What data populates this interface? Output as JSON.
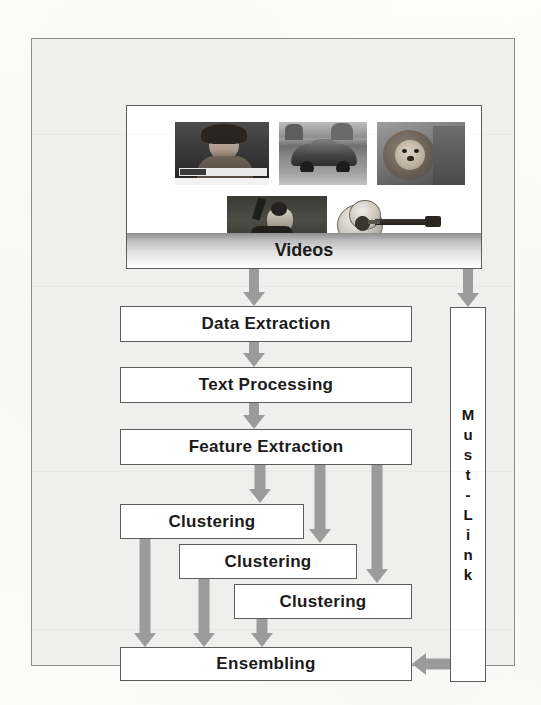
{
  "figure": {
    "source_box_label": "Videos",
    "constraint_label_chars": [
      "M",
      "u",
      "s",
      "t",
      "-",
      "L",
      "i",
      "n",
      "k"
    ],
    "constraint_label": "Must-Link",
    "stages": [
      {
        "id": "data-extraction",
        "label": "Data Extraction"
      },
      {
        "id": "text-processing",
        "label": "Text Processing"
      },
      {
        "id": "feature-extraction",
        "label": "Feature Extraction"
      }
    ],
    "clustering": [
      {
        "id": "clustering-1",
        "label": "Clustering"
      },
      {
        "id": "clustering-2",
        "label": "Clustering"
      },
      {
        "id": "clustering-3",
        "label": "Clustering"
      }
    ],
    "output": {
      "id": "ensembling",
      "label": "Ensembling"
    },
    "thumbnails": [
      {
        "id": "thumb-news-woman",
        "caption": "news broadcast woman"
      },
      {
        "id": "thumb-car",
        "caption": "vintage beetle car"
      },
      {
        "id": "thumb-lion",
        "caption": "lion"
      },
      {
        "id": "thumb-person-outdoors",
        "caption": "person sitting outdoors"
      },
      {
        "id": "thumb-guitar",
        "caption": "acoustic guitar"
      }
    ],
    "colors": {
      "arrow_gray": "#9b9b9b",
      "box_border": "#5c5c5c",
      "box_fill": "#ffffff",
      "frame_fill": "#efefed",
      "frame_border": "#8d8d8d",
      "text": "#1b1b1b"
    }
  }
}
